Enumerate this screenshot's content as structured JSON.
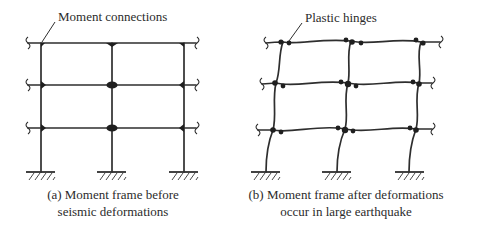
{
  "figure": {
    "panel_a": {
      "label": "Moment connections",
      "caption_line1": "(a) Moment frame before",
      "caption_line2": "seismic deformations"
    },
    "panel_b": {
      "label": "Plastic hinges",
      "caption_line1": "(b) Moment frame after deformations",
      "caption_line2": "occur in large earthquake"
    },
    "colors": {
      "line": "#2e2e2e",
      "text": "#2b2b2b",
      "background": "#ffffff"
    }
  }
}
